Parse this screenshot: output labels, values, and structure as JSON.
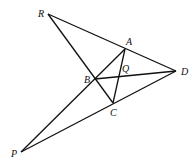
{
  "diagram": {
    "title": "",
    "points": {
      "R": {
        "x": 48,
        "y": 14,
        "label": "R",
        "lx": 38,
        "ly": 17
      },
      "A": {
        "x": 125,
        "y": 49,
        "label": "A",
        "lx": 126,
        "ly": 45
      },
      "D": {
        "x": 176,
        "y": 71,
        "label": "D",
        "lx": 181,
        "ly": 75
      },
      "B": {
        "x": 95,
        "y": 79,
        "label": "B",
        "lx": 84,
        "ly": 83
      },
      "Q": {
        "x": 121,
        "y": 76,
        "label": "Q",
        "lx": 122,
        "ly": 72
      },
      "C": {
        "x": 113,
        "y": 103,
        "label": "C",
        "lx": 110,
        "ly": 116
      },
      "P": {
        "x": 21,
        "y": 152,
        "label": "P",
        "lx": 11,
        "ly": 157
      }
    },
    "segments": [
      [
        "R",
        "D"
      ],
      [
        "R",
        "C"
      ],
      [
        "P",
        "A"
      ],
      [
        "P",
        "D"
      ],
      [
        "A",
        "C"
      ],
      [
        "B",
        "D"
      ]
    ],
    "labels": [
      "R",
      "A",
      "D",
      "B",
      "Q",
      "C",
      "P"
    ]
  }
}
